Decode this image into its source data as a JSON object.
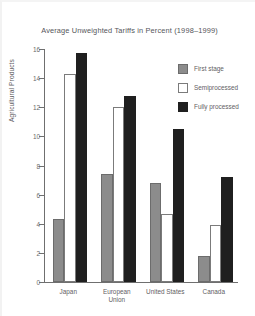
{
  "chart_data": {
    "type": "bar",
    "title": "Average Unweighted Tariffs in Percent (1998–1999)",
    "xlabel": "",
    "ylabel": "Agricultural Products",
    "categories": [
      "Japan",
      "European\nUnion",
      "United States",
      "Canada"
    ],
    "ylim": [
      0,
      16
    ],
    "yticks": [
      0,
      2,
      4,
      6,
      8,
      10,
      12,
      14,
      16
    ],
    "grid": false,
    "legend_position": "top-right",
    "series": [
      {
        "name": "First stage",
        "color": "#8c8c8c",
        "values": [
          4.3,
          7.4,
          6.8,
          1.8
        ]
      },
      {
        "name": "Semiprocessed",
        "color": "#ffffff",
        "values": [
          14.3,
          12.0,
          4.7,
          3.9
        ]
      },
      {
        "name": "Fully processed",
        "color": "#1f1f1f",
        "values": [
          15.7,
          12.8,
          10.5,
          7.2
        ]
      }
    ]
  },
  "axis": {
    "tick_labels": [
      "16",
      "14",
      "12",
      "10",
      "8",
      "6",
      "4",
      "2",
      "0"
    ]
  },
  "legend": {
    "items": [
      {
        "label": "First stage"
      },
      {
        "label": "Semiprocessed"
      },
      {
        "label": "Fully processed"
      }
    ]
  }
}
